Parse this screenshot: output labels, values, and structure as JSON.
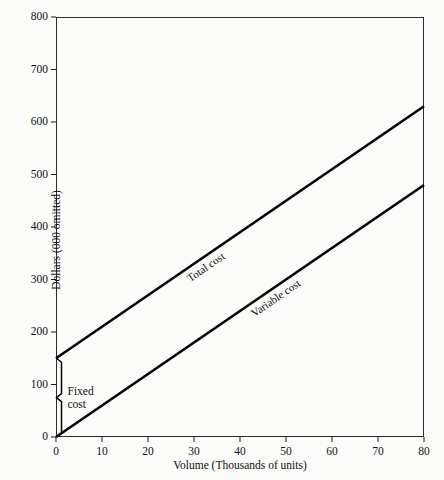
{
  "chart_data": {
    "type": "line",
    "title": "",
    "xlabel": "Volume (Thousands of units)",
    "ylabel": "Dollars (000 omitted)",
    "xlim": [
      0,
      80
    ],
    "ylim": [
      0,
      800
    ],
    "xticks": [
      0,
      10,
      20,
      30,
      40,
      50,
      60,
      70,
      80
    ],
    "yticks": [
      0,
      100,
      200,
      300,
      400,
      500,
      600,
      700,
      800
    ],
    "xtick_labels": [
      "0",
      "10",
      "20",
      "30",
      "40",
      "50",
      "60",
      "70",
      "80"
    ],
    "ytick_labels": [
      "0",
      "100",
      "200",
      "300",
      "400",
      "500",
      "600",
      "700",
      "800"
    ],
    "grid": false,
    "legend": "inline-labels",
    "series": [
      {
        "name": "Total cost",
        "x": [
          0,
          80
        ],
        "values": [
          150,
          630
        ],
        "intercept": 150,
        "slope_per_thousand_units": 6.0,
        "color": "#000000"
      },
      {
        "name": "Variable cost",
        "x": [
          0,
          80
        ],
        "values": [
          0,
          480
        ],
        "intercept": 0,
        "slope_per_thousand_units": 6.0,
        "color": "#000000"
      }
    ],
    "annotations": [
      {
        "name": "fixed-cost",
        "text_line_1": "Fixed",
        "text_line_2": "cost",
        "value": 150,
        "span_y": [
          0,
          150
        ],
        "at_x": 0
      }
    ]
  },
  "axes": {
    "y_title": "Dollars (000 omitted)",
    "x_title": "Volume (Thousands of units)"
  },
  "labels": {
    "total_cost": "Total cost",
    "variable_cost": "Variable cost",
    "fixed_cost_line_1": "Fixed",
    "fixed_cost_line_2": "cost"
  },
  "colors": {
    "background": "#fbfbfa",
    "line": "#000000",
    "axis": "#2b2b2b",
    "text": "#111111"
  }
}
